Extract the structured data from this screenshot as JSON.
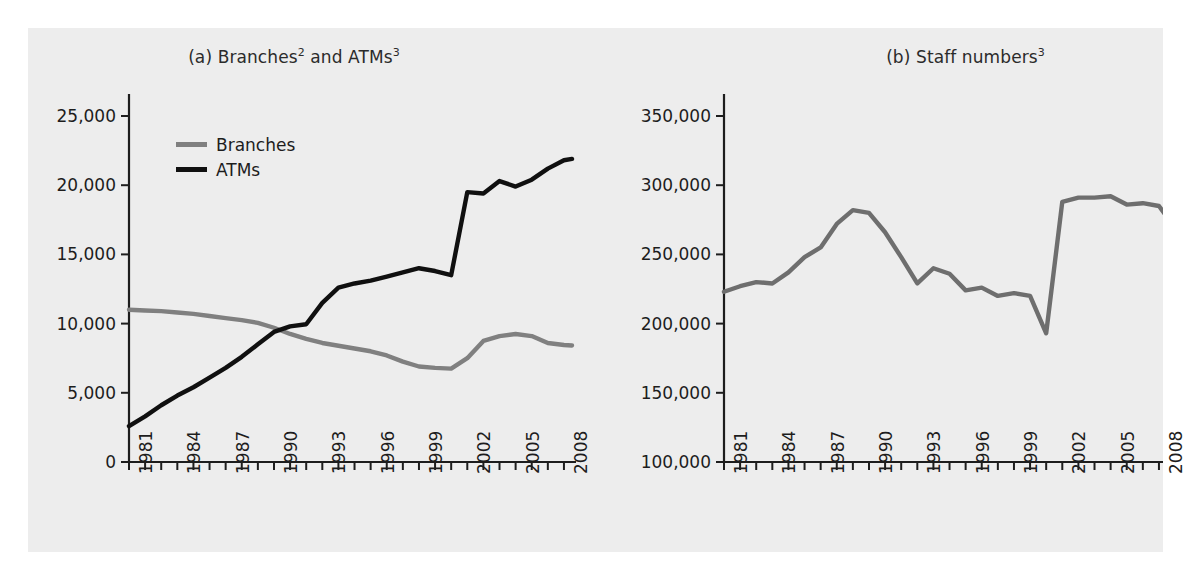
{
  "figure": {
    "background": "#ededed",
    "page_background": "#ffffff"
  },
  "panels": [
    {
      "id": "a",
      "title_prefix": "(a) Branches",
      "title_sup1": "2",
      "title_mid": " and ATMs",
      "title_sup2": "3",
      "title_full": "(a) Branches2 and ATMs3"
    },
    {
      "id": "b",
      "title_prefix": "(b) Staff numbers",
      "title_sup1": "3",
      "title_full": "(b) Staff numbers3"
    }
  ],
  "legend": {
    "position": "top-left-inside",
    "entries": [
      {
        "label": "Branches",
        "color": "#808080"
      },
      {
        "label": "ATMs",
        "color": "#101010"
      }
    ]
  },
  "colors": {
    "branches": "#808080",
    "atms": "#101010",
    "staff": "#6e6e6e",
    "axis": "#1d1d1d",
    "text": "#1d1d1d"
  },
  "chart_data": [
    {
      "type": "line",
      "title": "(a) Branches2 and ATMs3",
      "xlabel": "",
      "ylabel": "",
      "grid": false,
      "legend_position": "top-left-inside",
      "xlim": [
        1981,
        2008.5
      ],
      "ylim": [
        0,
        25000
      ],
      "yticks": [
        0,
        5000,
        10000,
        15000,
        20000,
        25000
      ],
      "ytick_labels": [
        "0",
        "5,000",
        "10,000",
        "15,000",
        "20,000",
        "25,000"
      ],
      "xticks": [
        1981,
        1984,
        1987,
        1990,
        1993,
        1996,
        1999,
        2002,
        2005,
        2008
      ],
      "xtick_labels": [
        "1981",
        "1984",
        "1987",
        "1990",
        "1993",
        "1996",
        "1999",
        "2002",
        "2005",
        "2008"
      ],
      "x": [
        1981,
        1982,
        1983,
        1984,
        1985,
        1986,
        1987,
        1988,
        1989,
        1990,
        1991,
        1992,
        1993,
        1994,
        1995,
        1996,
        1997,
        1998,
        1999,
        2000,
        2001,
        2002,
        2003,
        2004,
        2005,
        2006,
        2007,
        2008,
        2008.5
      ],
      "series": [
        {
          "name": "Branches",
          "color": "#808080",
          "values": [
            11000,
            10950,
            10900,
            10800,
            10700,
            10550,
            10400,
            10250,
            10050,
            9700,
            9250,
            8900,
            8600,
            8400,
            8200,
            8000,
            7700,
            7250,
            6900,
            6800,
            6750,
            7500,
            8750,
            9100,
            9250,
            9100,
            8600,
            8450,
            8420
          ]
        },
        {
          "name": "ATMs",
          "color": "#101010",
          "values": [
            2600,
            3300,
            4100,
            4800,
            5400,
            6100,
            6800,
            7600,
            8500,
            9400,
            9800,
            9950,
            11500,
            12600,
            12900,
            13100,
            13400,
            13700,
            14000,
            13800,
            13500,
            19500,
            19400,
            20300,
            19900,
            20400,
            21200,
            21800,
            21900
          ]
        }
      ]
    },
    {
      "type": "line",
      "title": "(b) Staff numbers3",
      "xlabel": "",
      "ylabel": "",
      "grid": false,
      "legend_position": "none",
      "xlim": [
        1981,
        2008.5
      ],
      "ylim": [
        100000,
        350000
      ],
      "yticks": [
        100000,
        150000,
        200000,
        250000,
        300000,
        350000
      ],
      "ytick_labels": [
        "100,000",
        "150,000",
        "200,000",
        "250,000",
        "300,000",
        "350,000"
      ],
      "xticks": [
        1981,
        1984,
        1987,
        1990,
        1993,
        1996,
        1999,
        2002,
        2005,
        2008
      ],
      "xtick_labels": [
        "1981",
        "1984",
        "1987",
        "1990",
        "1993",
        "1996",
        "1999",
        "2002",
        "2005",
        "2008"
      ],
      "x": [
        1981,
        1982,
        1983,
        1984,
        1985,
        1986,
        1987,
        1988,
        1989,
        1990,
        1991,
        1992,
        1993,
        1994,
        1995,
        1996,
        1997,
        1998,
        1999,
        2000,
        2001,
        2002,
        2003,
        2004,
        2005,
        2006,
        2007,
        2008,
        2008.5
      ],
      "series": [
        {
          "name": "Staff numbers",
          "color": "#6e6e6e",
          "values": [
            223000,
            227000,
            230000,
            229000,
            237000,
            248000,
            255000,
            272000,
            282000,
            280000,
            266000,
            248000,
            229000,
            240000,
            236000,
            224000,
            226000,
            220000,
            222000,
            220000,
            193000,
            288000,
            291000,
            291000,
            292000,
            286000,
            287000,
            285000,
            277000
          ]
        }
      ]
    }
  ]
}
